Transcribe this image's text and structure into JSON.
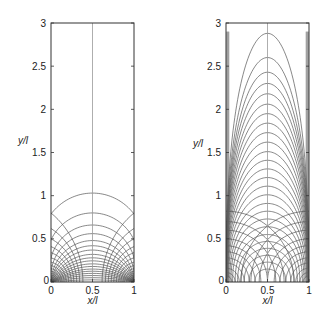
{
  "chart_data": [
    {
      "type": "line",
      "title": "",
      "description": "Bipolar coordinate field lines between two foci at (0,0) and (1,0): circles through both foci and Apollonius circles around each focus",
      "xlabel": "x/l",
      "ylabel": "y/l",
      "xlim": [
        0,
        1
      ],
      "ylim": [
        0,
        3
      ],
      "xticks": [
        "0",
        "0.5",
        "1"
      ],
      "yticks": [
        "0",
        "0.5",
        "1",
        "1.5",
        "2",
        "2.5",
        "3"
      ],
      "grid": false,
      "centerline_x": 0.5,
      "foci": [
        [
          0,
          0
        ],
        [
          1,
          0
        ]
      ],
      "through_foci_arc_apex_heights": [
        1.03,
        0.8,
        0.66,
        0.56,
        0.48,
        0.42,
        0.37,
        0.32,
        0.28,
        0.245,
        0.21,
        0.18,
        0.15,
        0.125,
        0.1,
        0.075,
        0.05,
        0.025
      ],
      "apollonius_circle_wall_heights": [
        0.8,
        0.62,
        0.5,
        0.41,
        0.34,
        0.28,
        0.23,
        0.19,
        0.155,
        0.125,
        0.1,
        0.08,
        0.06,
        0.045,
        0.03,
        0.02,
        0.01
      ]
    },
    {
      "type": "line",
      "title": "",
      "description": "Nested U-shaped field lines symmetric about x=0.5 with corner-centered orthogonal arcs",
      "xlabel": "x/l",
      "ylabel": "y/l",
      "xlim": [
        0,
        1
      ],
      "ylim": [
        0,
        3
      ],
      "xticks": [
        "0",
        "0.5",
        "1"
      ],
      "yticks": [
        "0",
        "0.5",
        "1",
        "1.5",
        "2",
        "2.5",
        "3"
      ],
      "grid": false,
      "centerline_x": 0.5,
      "u_curve_apex_heights": [
        2.88,
        2.6,
        2.43,
        2.3,
        2.18,
        2.06,
        1.95,
        1.84,
        1.73,
        1.62,
        1.51,
        1.41,
        1.31,
        1.21,
        1.11,
        1.01,
        0.91,
        0.82,
        0.73,
        0.64,
        0.55,
        0.47,
        0.39,
        0.31,
        0.23,
        0.15
      ],
      "u_curve_half_widths": [
        0.5,
        0.5,
        0.5,
        0.5,
        0.5,
        0.5,
        0.5,
        0.5,
        0.499,
        0.498,
        0.497,
        0.495,
        0.493,
        0.49,
        0.486,
        0.48,
        0.47,
        0.455,
        0.44,
        0.42,
        0.39,
        0.36,
        0.32,
        0.28,
        0.22,
        0.15
      ],
      "corner_arc_radii": [
        0.82,
        0.7,
        0.6,
        0.5,
        0.42,
        0.35,
        0.28,
        0.22,
        0.16,
        0.11,
        0.07
      ]
    }
  ],
  "panels": [
    {
      "ylabel": "y/l",
      "xlabel": "x/l",
      "yticks": [
        "0",
        "0.5",
        "1",
        "1.5",
        "2",
        "2.5",
        "3"
      ],
      "xticks": [
        "0",
        "0.5",
        "1"
      ]
    },
    {
      "ylabel": "y/l",
      "xlabel": "x/l",
      "yticks": [
        "0",
        "0.5",
        "1",
        "1.5",
        "2",
        "2.5",
        "3"
      ],
      "xticks": [
        "0",
        "0.5",
        "1"
      ]
    }
  ]
}
